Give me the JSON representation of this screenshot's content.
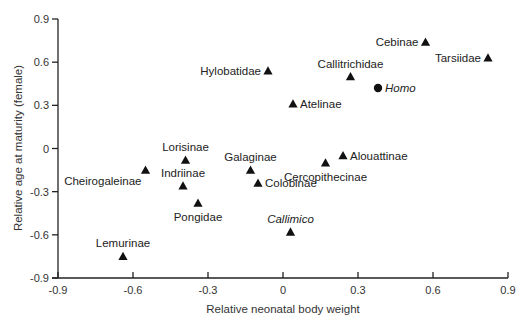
{
  "chart_data": {
    "type": "scatter",
    "title": "",
    "xlabel": "Relative neonatal body weight",
    "ylabel": "Relative age at maturity (female)",
    "xlim": [
      -0.9,
      0.9
    ],
    "ylim": [
      -0.9,
      0.9
    ],
    "xticks": [
      "-0.9",
      "-0.6",
      "-0.3",
      "0",
      "0.3",
      "0.6",
      "0.9"
    ],
    "yticks": [
      "0.9",
      "0.6",
      "0.3",
      "0",
      "-0.3",
      "-0.6",
      "-0.9"
    ],
    "grid": false,
    "legend": null,
    "points": [
      {
        "label": "Cebinae",
        "x": 0.57,
        "y": 0.74,
        "marker": "triangle",
        "italic": false,
        "label_pos": "left"
      },
      {
        "label": "Tarsiidae",
        "x": 0.82,
        "y": 0.63,
        "marker": "triangle",
        "italic": false,
        "label_pos": "left"
      },
      {
        "label": "Hylobatidae",
        "x": -0.06,
        "y": 0.54,
        "marker": "triangle",
        "italic": false,
        "label_pos": "left"
      },
      {
        "label": "Callitrichidae",
        "x": 0.27,
        "y": 0.5,
        "marker": "triangle",
        "italic": false,
        "label_pos": "above"
      },
      {
        "label": "Homo",
        "x": 0.38,
        "y": 0.42,
        "marker": "circle",
        "italic": true,
        "label_pos": "right"
      },
      {
        "label": "Atelinae",
        "x": 0.04,
        "y": 0.31,
        "marker": "triangle",
        "italic": false,
        "label_pos": "right"
      },
      {
        "label": "Alouattinae",
        "x": 0.24,
        "y": -0.05,
        "marker": "triangle",
        "italic": false,
        "label_pos": "right"
      },
      {
        "label": "Cercopithecinae",
        "x": 0.17,
        "y": -0.1,
        "marker": "triangle",
        "italic": false,
        "label_pos": "below"
      },
      {
        "label": "Galaginae",
        "x": -0.13,
        "y": -0.15,
        "marker": "triangle",
        "italic": false,
        "label_pos": "above"
      },
      {
        "label": "Colobinae",
        "x": -0.1,
        "y": -0.24,
        "marker": "triangle",
        "italic": false,
        "label_pos": "right"
      },
      {
        "label": "Lorisinae",
        "x": -0.39,
        "y": -0.08,
        "marker": "triangle",
        "italic": false,
        "label_pos": "above"
      },
      {
        "label": "Cheirogaleinae",
        "x": -0.55,
        "y": -0.15,
        "marker": "triangle",
        "italic": false,
        "label_pos": "below-left"
      },
      {
        "label": "Indriinae",
        "x": -0.4,
        "y": -0.26,
        "marker": "triangle",
        "italic": false,
        "label_pos": "above"
      },
      {
        "label": "Pongidae",
        "x": -0.34,
        "y": -0.38,
        "marker": "triangle",
        "italic": false,
        "label_pos": "below"
      },
      {
        "label": "Callimico",
        "x": 0.03,
        "y": -0.58,
        "marker": "triangle",
        "italic": true,
        "label_pos": "above"
      },
      {
        "label": "Lemurinae",
        "x": -0.64,
        "y": -0.75,
        "marker": "triangle",
        "italic": false,
        "label_pos": "above"
      }
    ]
  },
  "colors": {
    "axis": "#222222",
    "marker": "#111111",
    "text": "#222222",
    "background": "#ffffff"
  }
}
